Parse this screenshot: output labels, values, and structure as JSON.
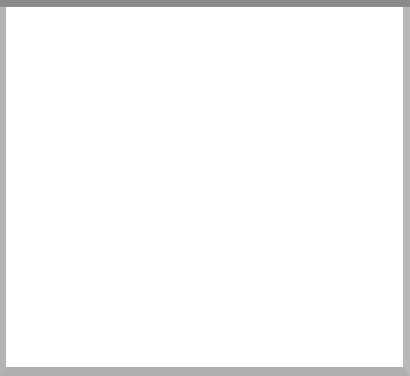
{
  "chart_data": {
    "type": "line",
    "title": "",
    "xlabel": "Year",
    "ylabel": "Rating (in percent)",
    "x": [
      1985,
      1990,
      1995,
      2000,
      2002,
      2004
    ],
    "categories": [
      "1985",
      "1990",
      "1995",
      "2000",
      "2002",
      "2004"
    ],
    "xtick_labels": [
      "1985",
      "1990",
      "1995",
      "2000",
      "2002",
      "2004"
    ],
    "ytick_labels": [
      "0",
      "5",
      "10",
      "15",
      "20",
      "25",
      "30",
      "35",
      "40"
    ],
    "ytick_values": [
      0,
      5,
      10,
      15,
      20,
      25,
      30,
      35,
      40
    ],
    "ylim": [
      0,
      40
    ],
    "grid": false,
    "legend_position": "bottom",
    "series": [
      {
        "name": "CBS",
        "color": "#bdbdbd",
        "width": 2.2,
        "values": [
          11.8,
          8.5,
          8.0,
          9.0,
          5.8,
          5.0
        ]
      },
      {
        "name": "NBC",
        "color": "#d4d4d4",
        "width": 2.2,
        "values": [
          11.7,
          8.6,
          9.8,
          8.3,
          6.0,
          4.9
        ]
      },
      {
        "name": "ABC",
        "color": "#0a0a0a",
        "width": 2.6,
        "values": [
          13.5,
          10.0,
          9.8,
          7.0,
          5.8,
          6.0
        ]
      },
      {
        "name": "3 Networks",
        "color": "#6e6e6e",
        "width": 2.2,
        "values": [
          37.0,
          26.8,
          27.3,
          25.0,
          18.0,
          17.5
        ]
      }
    ]
  },
  "axes": {
    "x_axis_title": "Year",
    "y_axis_title": "Rating (in percent)"
  },
  "legend": {
    "entries": [
      {
        "label": "CBS"
      },
      {
        "label": "NBC"
      },
      {
        "label": "ABC"
      },
      {
        "label": "3 Networks"
      }
    ]
  }
}
